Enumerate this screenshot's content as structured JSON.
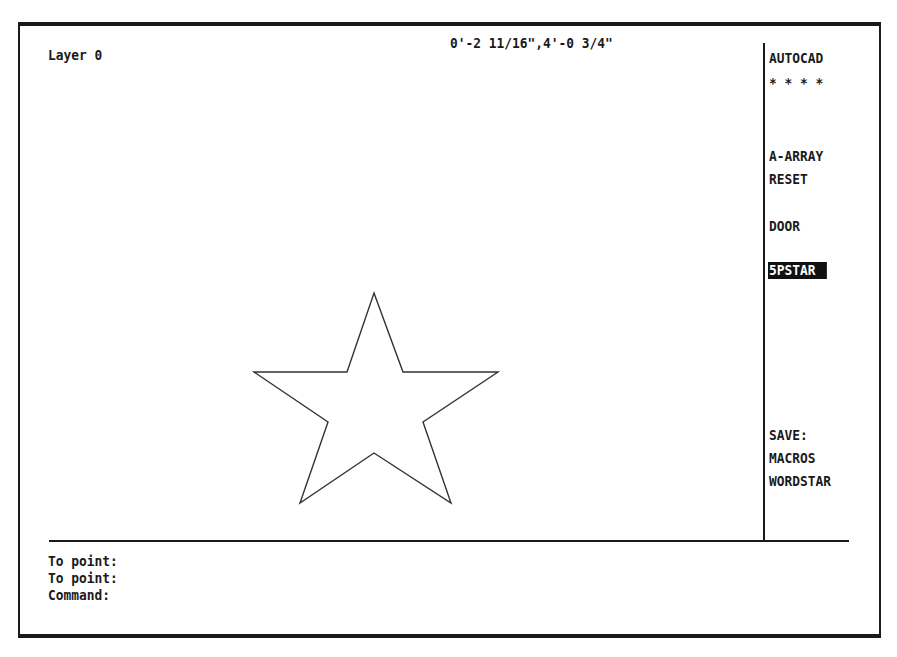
{
  "status": {
    "layer": "Layer 0",
    "coordinates": "0'-2 11/16\",4'-0 3/4\""
  },
  "screen_menu": {
    "title": "AUTOCAD",
    "separator": "* * * *",
    "items": [
      {
        "label": "A-ARRAY",
        "selected": false
      },
      {
        "label": "RESET",
        "selected": false
      },
      {
        "label": "DOOR",
        "selected": false
      },
      {
        "label": "5PSTAR",
        "selected": true
      },
      {
        "label": "SAVE:",
        "selected": false
      },
      {
        "label": "MACROS",
        "selected": false
      },
      {
        "label": "WORDSTAR",
        "selected": false
      }
    ]
  },
  "drawing": {
    "shape": "five-point-star",
    "stroke_color": "#333333",
    "vertices": [
      [
        374,
        293
      ],
      [
        403,
        372
      ],
      [
        498,
        372
      ],
      [
        423,
        422
      ],
      [
        451,
        503
      ],
      [
        374,
        453
      ],
      [
        300,
        503
      ],
      [
        328,
        422
      ],
      [
        254,
        372
      ],
      [
        347,
        372
      ]
    ]
  },
  "command_area": {
    "lines": [
      "To point:",
      "To point:",
      "Command:"
    ]
  },
  "colors": {
    "background": "#ffffff",
    "foreground": "#1a1a1a",
    "selection_bg": "#111111",
    "selection_fg": "#ffffff"
  }
}
